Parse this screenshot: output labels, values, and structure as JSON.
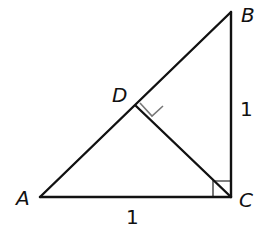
{
  "diagram": {
    "type": "right-triangle-with-altitude",
    "points": {
      "A": {
        "label": "A",
        "x": 40,
        "y": 197
      },
      "B": {
        "label": "B",
        "x": 231,
        "y": 12
      },
      "C": {
        "label": "C",
        "x": 231,
        "y": 197
      },
      "D": {
        "label": "D",
        "x": 136,
        "y": 106
      }
    },
    "segments": [
      {
        "from": "A",
        "to": "C"
      },
      {
        "from": "C",
        "to": "B"
      },
      {
        "from": "A",
        "to": "B"
      },
      {
        "from": "C",
        "to": "D"
      }
    ],
    "right_angles": [
      "C",
      "D"
    ],
    "side_labels": {
      "AC": "1",
      "BC": "1"
    },
    "colors": {
      "line": "#111111",
      "right_angle_mark_D": "#777777",
      "right_angle_mark_C": "#555555",
      "background": "#ffffff"
    }
  }
}
